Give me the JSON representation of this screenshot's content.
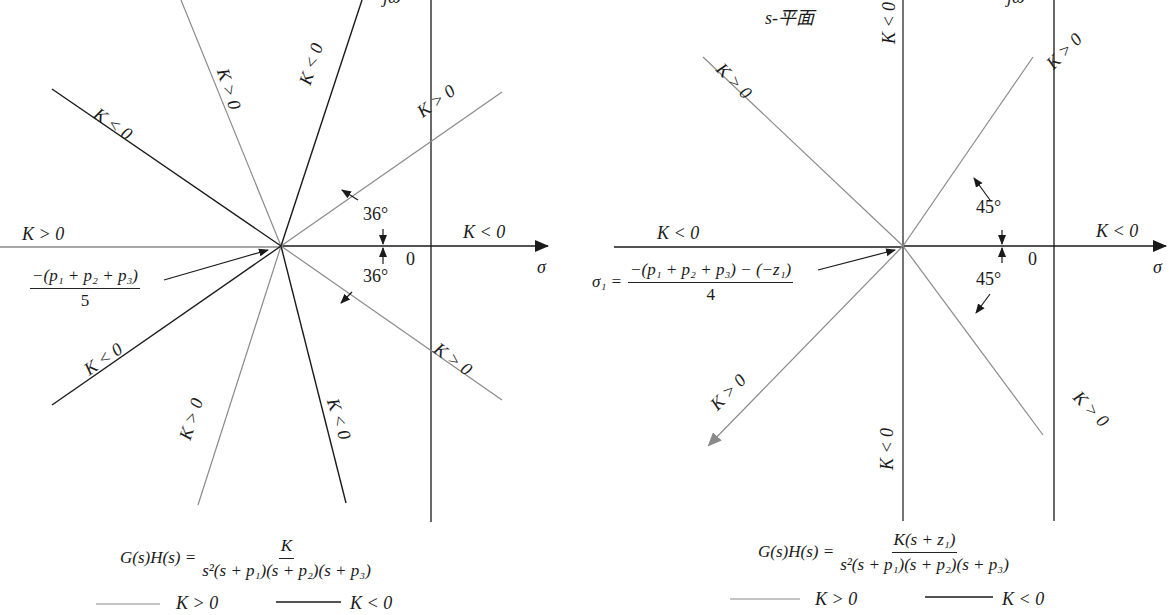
{
  "colors": {
    "k_pos_line": "#8a8a8a",
    "k_neg_line": "#1a1a1a",
    "axis": "#1a1a1a",
    "background": "#ffffff"
  },
  "left_diagram": {
    "axis_labels": {
      "imag": "jω",
      "real": "σ",
      "origin": "0"
    },
    "asymptote_labels": {
      "left_horizontal": "K > 0",
      "right_horizontal": "K < 0",
      "upper_left_144": "K < 0",
      "upper_108": "K > 0",
      "upper_72": "K < 0",
      "upper_36": "K > 0",
      "lower_36": "K > 0",
      "lower_72": "K < 0",
      "lower_108": "K > 0",
      "lower_left_144": "K < 0"
    },
    "angle_upper": "36°",
    "angle_lower": "36°",
    "centroid_numerator": "−(p₁ + p₂ + p₃)",
    "centroid_denominator": "5",
    "transfer_function": {
      "lhs": "G(s)H(s) =",
      "numerator": "K",
      "denominator": "s²(s + p₁)(s + p₂)(s + p₃)"
    },
    "legend": [
      {
        "label": "K > 0",
        "style": "light"
      },
      {
        "label": "K < 0",
        "style": "dark"
      }
    ]
  },
  "right_diagram": {
    "plane_label": "s-平面",
    "axis_labels": {
      "imag": "jω",
      "real": "σ",
      "origin": "0"
    },
    "asymptote_labels": {
      "left_horizontal": "K < 0",
      "right_horizontal": "K < 0",
      "vertical_up": "K < 0",
      "vertical_down": "K < 0",
      "upper_left_135": "K > 0",
      "upper_right_45": "K > 0",
      "lower_right_45": "K > 0",
      "lower_left_135": "K > 0"
    },
    "angle_upper": "45°",
    "angle_lower": "45°",
    "centroid_lhs": "σ₁ =",
    "centroid_numerator": "−(p₁ + p₂ + p₃) − (−z₁)",
    "centroid_denominator": "4",
    "transfer_function": {
      "lhs": "G(s)H(s) =",
      "numerator": "K(s + z₁)",
      "denominator": "s²(s + p₁)(s + p₂)(s + p₃)"
    },
    "legend": [
      {
        "label": "K > 0",
        "style": "light"
      },
      {
        "label": "K < 0",
        "style": "dark"
      }
    ]
  }
}
